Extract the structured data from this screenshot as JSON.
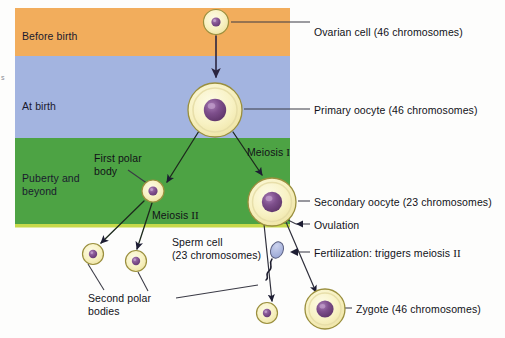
{
  "figure": {
    "edge_artifact": "s"
  },
  "bands": [
    {
      "id": "before-birth",
      "label": "Before birth",
      "color": "#f2ad5c",
      "y": 8,
      "height": 48
    },
    {
      "id": "at-birth",
      "label": "At birth",
      "color": "#a3b4e0",
      "y": 56,
      "height": 82
    },
    {
      "id": "puberty",
      "label": "Puberty and\nbeyond",
      "color": "#4da344",
      "y": 138,
      "height": 89
    }
  ],
  "cells": [
    {
      "id": "ovarian-cell",
      "name": "Ovarian cell",
      "cx": 216,
      "cy": 22,
      "r": 12.5,
      "nucleus_r": 4.5
    },
    {
      "id": "primary-oocyte",
      "name": "Primary oocyte",
      "cx": 215,
      "cy": 110,
      "r": 27,
      "nucleus_r": 11
    },
    {
      "id": "first-polar-body",
      "name": "First polar body",
      "cx": 153,
      "cy": 191,
      "r": 11,
      "nucleus_r": 4.5
    },
    {
      "id": "secondary-oocyte",
      "name": "Secondary oocyte",
      "cx": 272,
      "cy": 202,
      "r": 24,
      "nucleus_r": 10
    },
    {
      "id": "second-polar-body-1",
      "name": "Second polar body",
      "cx": 93,
      "cy": 254,
      "r": 10.5,
      "nucleus_r": 4
    },
    {
      "id": "second-polar-body-2",
      "name": "Second polar body",
      "cx": 136,
      "cy": 261,
      "r": 10.5,
      "nucleus_r": 4
    },
    {
      "id": "second-polar-body-3",
      "name": "Second polar body",
      "cx": 267,
      "cy": 313,
      "r": 10.5,
      "nucleus_r": 4
    },
    {
      "id": "zygote",
      "name": "Zygote",
      "cx": 325,
      "cy": 309,
      "r": 20,
      "nucleus_r": 8.5
    }
  ],
  "sperm": {
    "id": "sperm-cell",
    "name": "Sperm cell",
    "cx": 277,
    "cy": 253
  },
  "in_diagram_labels": [
    {
      "id": "first-polar-body-label",
      "text": "First polar\nbody",
      "x": 94,
      "y": 152
    },
    {
      "id": "meiosis-one-label",
      "text": "Meiosis ",
      "roman": "I",
      "x": 247,
      "y": 146
    },
    {
      "id": "meiosis-two-label",
      "text": "Meiosis ",
      "roman": "II",
      "x": 152,
      "y": 209
    },
    {
      "id": "sperm-cell-label",
      "text": "Sperm cell\n(23 chromosomes)",
      "x": 172,
      "y": 236
    },
    {
      "id": "second-polar-bodies-label",
      "text": "Second polar\nbodies",
      "x": 88,
      "y": 292
    }
  ],
  "right_labels": [
    {
      "id": "ovarian-cell-label",
      "text": "Ovarian cell (46 chromosomes)",
      "x": 314,
      "y": 26
    },
    {
      "id": "primary-oocyte-label",
      "text": "Primary oocyte (46 chromosomes)",
      "x": 314,
      "y": 104
    },
    {
      "id": "secondary-oocyte-label",
      "text": "Secondary oocyte (23 chromosomes)",
      "x": 314,
      "y": 196
    },
    {
      "id": "ovulation-label",
      "text": "Ovulation",
      "x": 314,
      "y": 219
    },
    {
      "id": "fertilization-label",
      "text": "Fertilization:  triggers meiosis ",
      "roman": "II",
      "x": 314,
      "y": 249
    },
    {
      "id": "zygote-label",
      "text": "Zygote (46 chromosomes)",
      "x": 356,
      "y": 304
    }
  ],
  "colors": {
    "band_before_birth": "#f2ad5c",
    "band_at_birth": "#a3b4e0",
    "band_puberty": "#4da344",
    "band_puberty_edge": "#c7d94a",
    "cytoplasm_outer": "#f6efb4",
    "cytoplasm_inner": "#fbf7d8",
    "cell_outline": "#9a8f3e",
    "nucleus": "#7a4a86",
    "nucleus_highlight": "#b48cc0",
    "sperm_head": "#aab4dd",
    "arrow_dark": "#1d1d33",
    "arrow_brown": "#4a3424",
    "leader_line": "#3a3a45",
    "text": "#111118"
  }
}
